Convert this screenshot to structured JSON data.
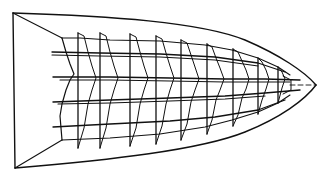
{
  "figure": {
    "stroke_color": "#111111",
    "background": "#ffffff",
    "hull": {
      "transom_top": [
        13,
        13
      ],
      "transom_bottom": [
        15,
        168
      ],
      "bow_tip": [
        316,
        85
      ]
    },
    "inner_frame": {
      "top_corner": [
        62,
        38
      ],
      "bottom_corner": [
        62,
        140
      ]
    },
    "stations_x": [
      78,
      100,
      128,
      153,
      178,
      205,
      232,
      258,
      278
    ],
    "stringers_y": [
      52,
      77,
      100,
      125
    ]
  }
}
